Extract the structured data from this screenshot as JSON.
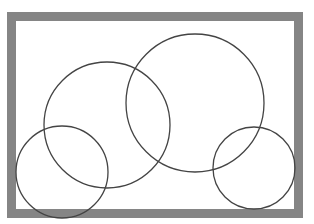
{
  "canvas": {
    "width": 314,
    "height": 224,
    "background": "#ffffff"
  },
  "frame": {
    "x": 7,
    "y": 12,
    "width": 296,
    "height": 206,
    "border_width": 9,
    "border_color": "#858585",
    "fill": "#ffffff"
  },
  "circles": [
    {
      "id": "circle-center-left",
      "cx": 107,
      "cy": 125,
      "r": 63
    },
    {
      "id": "circle-top-right",
      "cx": 195,
      "cy": 103,
      "r": 69
    },
    {
      "id": "circle-bottom-right",
      "cx": 254,
      "cy": 168,
      "r": 41
    },
    {
      "id": "circle-bottom-left",
      "cx": 62,
      "cy": 172,
      "r": 46
    }
  ],
  "stroke": {
    "color": "#444444",
    "width": 1.3
  }
}
